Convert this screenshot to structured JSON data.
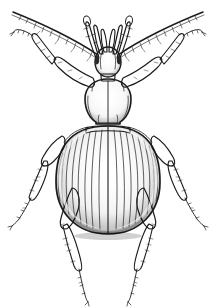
{
  "figure": {
    "kind": "scientific-illustration",
    "technique": "pen-and-ink stipple and line engraving",
    "orientation": "dorsal, head at top",
    "background_color": "#ffffff",
    "ink_color": "#1c1c1c",
    "stipple_color": "#555555",
    "caption": "",
    "title": "",
    "label": ""
  },
  "canvas": {
    "width": 216,
    "height": 308
  },
  "anatomy": {
    "head": {
      "name": "head",
      "center_x": 108,
      "center_y": 62,
      "width": 26,
      "height": 30
    },
    "mandibles": {
      "name": "mandibles",
      "count": 2,
      "tip_y": 30
    },
    "maxillary_palps": {
      "name": "maxillary-palps",
      "count": 2,
      "segments": 4,
      "tip_y": 18
    },
    "labial_palps": {
      "name": "labial-palps",
      "count": 2,
      "segments": 3,
      "tip_y": 26
    },
    "antennae": {
      "name": "antennae",
      "count": 2,
      "segments": 11,
      "left_tip_x": 12,
      "left_tip_y": 12,
      "right_tip_x": 203,
      "right_tip_y": 12
    },
    "pronotum": {
      "name": "pronotum",
      "shape": "cordate",
      "center_x": 108,
      "center_y": 101,
      "width": 46,
      "height": 44,
      "midline": true
    },
    "elytra": {
      "name": "elytra",
      "shape": "broad oval",
      "center_x": 108,
      "center_y": 180,
      "width": 100,
      "height": 110,
      "stria_count": 16,
      "suture": true,
      "top_y": 126,
      "bottom_y": 234
    },
    "legs": {
      "name": "legs",
      "count": 6,
      "pairs": [
        "fore",
        "mid",
        "hind"
      ],
      "segments": [
        "coxa",
        "trochanter",
        "femur",
        "tibia",
        "tarsus"
      ],
      "tarsal_segments": 5,
      "claws": 2
    }
  },
  "palette": {
    "paper": "#ffffff",
    "outline": "#1c1c1c",
    "shadow": "#4a4a4a",
    "light": "#8c8c8c"
  }
}
